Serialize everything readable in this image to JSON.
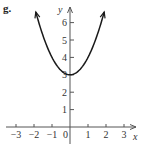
{
  "panel_label": "g.",
  "chart_data": {
    "type": "line",
    "title": "",
    "function": "y = x^2 + 3",
    "xlabel": "x",
    "ylabel": "y",
    "xlim": [
      -3.4,
      3.6
    ],
    "ylim": [
      -0.5,
      7
    ],
    "x_ticks": [
      -3,
      -2,
      -1,
      0,
      1,
      2,
      3
    ],
    "x_tick_labels": [
      "-3",
      "-2",
      "-1",
      "0",
      "1",
      "2",
      "3"
    ],
    "y_ticks": [
      1,
      2,
      3,
      4,
      5,
      6
    ],
    "y_tick_labels": [
      "1",
      "2",
      "3",
      "4",
      "5",
      "6"
    ],
    "grid": false,
    "legend": null,
    "series": [
      {
        "name": "parabola",
        "x": [
          -1.9,
          -1.5,
          -1,
          -0.5,
          0,
          0.5,
          1,
          1.5,
          1.9
        ],
        "y": [
          6.61,
          5.25,
          4,
          3.25,
          3,
          3.25,
          4,
          5.25,
          6.61
        ],
        "arrows_at_ends": true
      }
    ]
  },
  "colors": {
    "axis": "#555555",
    "curve": "#1a1a1a"
  }
}
